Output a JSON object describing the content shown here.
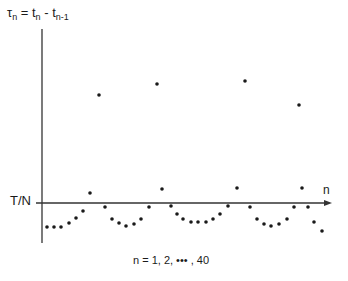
{
  "chart_data": {
    "type": "scatter",
    "title": "",
    "ylabel_main": "τ",
    "ylabel_sub": "n",
    "ylabel_rest": " = t",
    "ylabel_sub2": "n",
    "ylabel_rest2": " - t",
    "ylabel_sub3": "n-1",
    "ylabel_full": "τn = tn - tn-1",
    "xlabel": "n",
    "reference_label": "T/N",
    "caption": "n = 1, 2, ••• , 40",
    "axis": {
      "origin_px": [
        42,
        203
      ],
      "x_end_px": 330,
      "y_top_px": 29,
      "y_bottom_px": 243
    },
    "points_px": [
      [
        47,
        227
      ],
      [
        54,
        227
      ],
      [
        61,
        227
      ],
      [
        69,
        223
      ],
      [
        76,
        218
      ],
      [
        83,
        211
      ],
      [
        90,
        193
      ],
      [
        99,
        95
      ],
      [
        105,
        207
      ],
      [
        112,
        219
      ],
      [
        119,
        223
      ],
      [
        126,
        226
      ],
      [
        134,
        224
      ],
      [
        141,
        219
      ],
      [
        149,
        207
      ],
      [
        157,
        84
      ],
      [
        162,
        189
      ],
      [
        171,
        206
      ],
      [
        177,
        214
      ],
      [
        183,
        219
      ],
      [
        191,
        222
      ],
      [
        198,
        222
      ],
      [
        206,
        222
      ],
      [
        213,
        219
      ],
      [
        220,
        214
      ],
      [
        228,
        206
      ],
      [
        237,
        188
      ],
      [
        245,
        81
      ],
      [
        250,
        207
      ],
      [
        257,
        219
      ],
      [
        264,
        224
      ],
      [
        271,
        226
      ],
      [
        279,
        224
      ],
      [
        287,
        219
      ],
      [
        294,
        207
      ],
      [
        299,
        105
      ],
      [
        302,
        188
      ],
      [
        308,
        207
      ],
      [
        314,
        222
      ],
      [
        322,
        231
      ]
    ],
    "grid": false,
    "legend": null
  }
}
